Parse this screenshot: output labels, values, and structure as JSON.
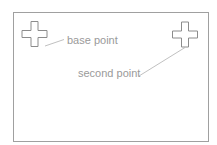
{
  "diagram": {
    "frame": {
      "x": 13,
      "y": 12,
      "width": 195,
      "height": 129,
      "stroke": "#a0a0a0"
    },
    "markers": [
      {
        "name": "base-point-cross",
        "cx": 34.5,
        "cy": 34,
        "size": 25,
        "arm": 7,
        "stroke": "#8c8c8c"
      },
      {
        "name": "second-point-cross",
        "cx": 185,
        "cy": 34.5,
        "size": 25,
        "arm": 7,
        "stroke": "#8c8c8c"
      }
    ],
    "labels": {
      "base_point": "base point",
      "second_point": "second point"
    },
    "leaders": [
      {
        "from": [
          45,
          46
        ],
        "to": [
          64,
          39
        ],
        "stroke": "#b0b0b0"
      },
      {
        "from": [
          139,
          76
        ],
        "to": [
          185,
          47
        ],
        "stroke": "#b0b0b0"
      }
    ],
    "colors": {
      "text": "#9a9a9a",
      "frame": "#a0a0a0",
      "cross": "#8c8c8c",
      "leader": "#b0b0b0"
    }
  }
}
